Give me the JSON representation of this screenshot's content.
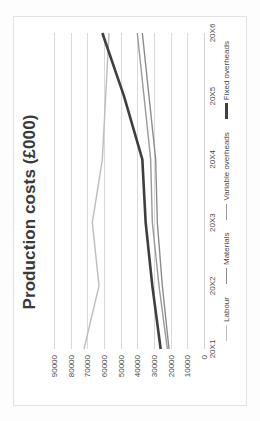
{
  "chart_data": {
    "type": "line",
    "title": "Production costs (£000)",
    "xlabel": "",
    "ylabel": "",
    "categories": [
      "20X1",
      "20X2",
      "20X3",
      "20X4",
      "20X5",
      "20X6"
    ],
    "ylim": [
      0,
      90000
    ],
    "yticks": [
      "0",
      "10000",
      "20000",
      "30000",
      "40000",
      "50000",
      "60000",
      "70000",
      "80000",
      "90000"
    ],
    "ytick_values": [
      0,
      10000,
      20000,
      30000,
      40000,
      50000,
      60000,
      70000,
      80000,
      90000
    ],
    "grid": true,
    "legend_position": "bottom",
    "series": [
      {
        "name": "Labour",
        "color": "#bdbdbd",
        "width": 1.4,
        "values": [
          72000,
          63000,
          67000,
          61000,
          59000,
          57000
        ]
      },
      {
        "name": "Materials",
        "color": "#8c8c8c",
        "width": 1.4,
        "values": [
          21000,
          25000,
          28000,
          29000,
          33000,
          37000
        ]
      },
      {
        "name": "Variable overheads",
        "color": "#9a9a9a",
        "width": 1.4,
        "values": [
          22000,
          27000,
          31000,
          32000,
          36000,
          40000
        ]
      },
      {
        "name": "Fixed overheads",
        "color": "#3f3f3f",
        "width": 2.6,
        "values": [
          26000,
          31000,
          35000,
          37000,
          48000,
          61000
        ]
      }
    ]
  },
  "frame": {
    "border_color": "#e2e2e2",
    "background": "#ffffff"
  }
}
